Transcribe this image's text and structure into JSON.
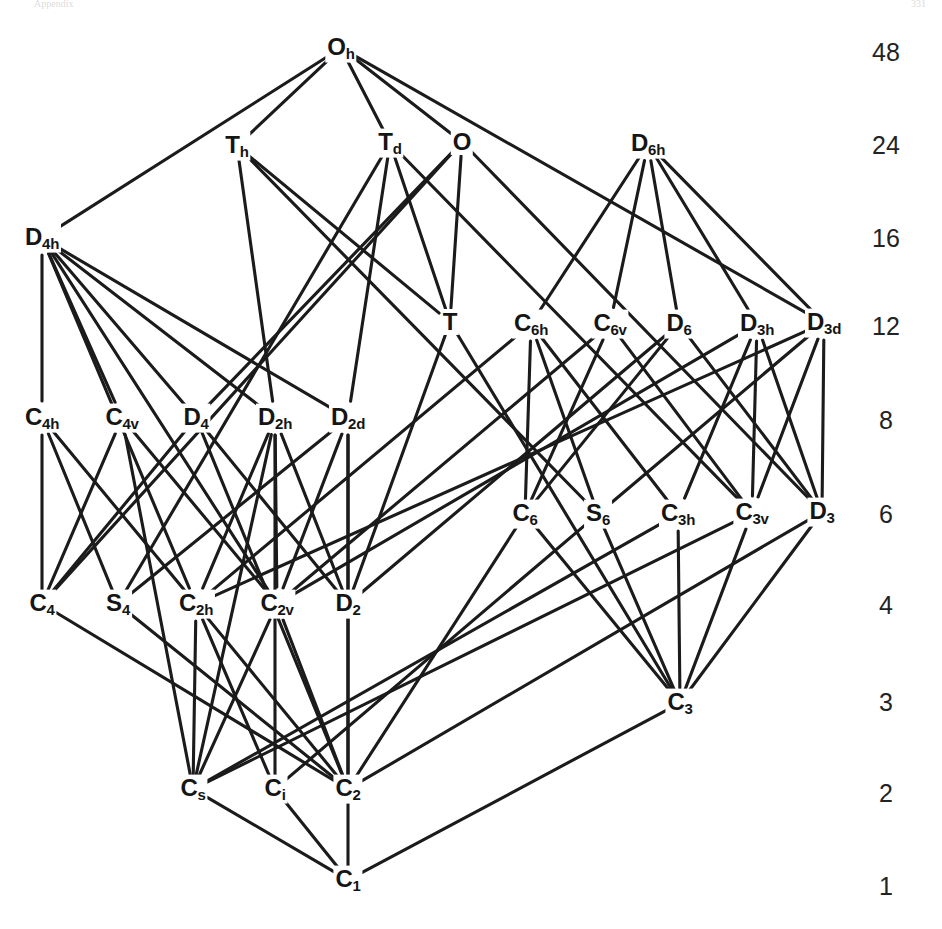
{
  "figure": {
    "kind": "subgroup-lattice",
    "header_left": "Appendix",
    "header_right": "331",
    "line_color": "#1b1b1b",
    "text_color": "#151515",
    "background": "#ffffff"
  },
  "order_axis": {
    "name": "group-order-column",
    "x": 886,
    "ticks": [
      {
        "label": "48",
        "y": 52
      },
      {
        "label": "24",
        "y": 145
      },
      {
        "label": "16",
        "y": 238
      },
      {
        "label": "12",
        "y": 326
      },
      {
        "label": "8",
        "y": 420
      },
      {
        "label": "6",
        "y": 514
      },
      {
        "label": "4",
        "y": 605
      },
      {
        "label": "3",
        "y": 702
      },
      {
        "label": "2",
        "y": 793
      },
      {
        "label": "1",
        "y": 886
      }
    ]
  },
  "nodes": [
    {
      "id": "Oh",
      "base": "O",
      "sub": "h",
      "x": 341,
      "y": 48,
      "order": 48
    },
    {
      "id": "Th",
      "base": "T",
      "sub": "h",
      "x": 237,
      "y": 146,
      "order": 24
    },
    {
      "id": "Td",
      "base": "T",
      "sub": "d",
      "x": 390,
      "y": 143,
      "order": 24
    },
    {
      "id": "O",
      "base": "O",
      "sub": "",
      "x": 462,
      "y": 142,
      "order": 24
    },
    {
      "id": "D6h",
      "base": "D",
      "sub": "6h",
      "x": 648,
      "y": 144,
      "order": 24
    },
    {
      "id": "D4h",
      "base": "D",
      "sub": "4h",
      "x": 42,
      "y": 238,
      "order": 16
    },
    {
      "id": "T",
      "base": "T",
      "sub": "",
      "x": 450,
      "y": 322,
      "order": 12
    },
    {
      "id": "C6h",
      "base": "C",
      "sub": "6h",
      "x": 531,
      "y": 324,
      "order": 12
    },
    {
      "id": "C6v",
      "base": "C",
      "sub": "6v",
      "x": 610,
      "y": 324,
      "order": 12
    },
    {
      "id": "D6",
      "base": "D",
      "sub": "6",
      "x": 679,
      "y": 324,
      "order": 12
    },
    {
      "id": "D3h",
      "base": "D",
      "sub": "3h",
      "x": 757,
      "y": 324,
      "order": 12
    },
    {
      "id": "D3d",
      "base": "D",
      "sub": "3d",
      "x": 824,
      "y": 323,
      "order": 12
    },
    {
      "id": "C4h",
      "base": "C",
      "sub": "4h",
      "x": 42,
      "y": 418,
      "order": 8
    },
    {
      "id": "C4v",
      "base": "C",
      "sub": "4v",
      "x": 122,
      "y": 418,
      "order": 8
    },
    {
      "id": "D4",
      "base": "D",
      "sub": "4",
      "x": 196,
      "y": 418,
      "order": 8
    },
    {
      "id": "D2h",
      "base": "D",
      "sub": "2h",
      "x": 275,
      "y": 418,
      "order": 8
    },
    {
      "id": "D2d",
      "base": "D",
      "sub": "2d",
      "x": 348,
      "y": 418,
      "order": 8
    },
    {
      "id": "C6",
      "base": "C",
      "sub": "6",
      "x": 525,
      "y": 514,
      "order": 6
    },
    {
      "id": "S6",
      "base": "S",
      "sub": "6",
      "x": 598,
      "y": 514,
      "order": 6
    },
    {
      "id": "C3h",
      "base": "C",
      "sub": "3h",
      "x": 678,
      "y": 514,
      "order": 6
    },
    {
      "id": "C3v",
      "base": "C",
      "sub": "3v",
      "x": 752,
      "y": 513,
      "order": 6
    },
    {
      "id": "D3",
      "base": "D",
      "sub": "3",
      "x": 822,
      "y": 512,
      "order": 6
    },
    {
      "id": "C4",
      "base": "C",
      "sub": "4",
      "x": 42,
      "y": 604,
      "order": 4
    },
    {
      "id": "S4",
      "base": "S",
      "sub": "4",
      "x": 118,
      "y": 604,
      "order": 4
    },
    {
      "id": "C2h",
      "base": "C",
      "sub": "2h",
      "x": 196,
      "y": 604,
      "order": 4
    },
    {
      "id": "C2v",
      "base": "C",
      "sub": "2v",
      "x": 277,
      "y": 604,
      "order": 4
    },
    {
      "id": "D2",
      "base": "D",
      "sub": "2",
      "x": 348,
      "y": 604,
      "order": 4
    },
    {
      "id": "C3",
      "base": "C",
      "sub": "3",
      "x": 680,
      "y": 703,
      "order": 3
    },
    {
      "id": "Cs",
      "base": "C",
      "sub": "s",
      "x": 193,
      "y": 789,
      "order": 2
    },
    {
      "id": "Ci",
      "base": "C",
      "sub": "i",
      "x": 275,
      "y": 789,
      "order": 2
    },
    {
      "id": "C2",
      "base": "C",
      "sub": "2",
      "x": 348,
      "y": 789,
      "order": 2
    },
    {
      "id": "C1",
      "base": "C",
      "sub": "1",
      "x": 348,
      "y": 880,
      "order": 1
    }
  ],
  "edges": [
    [
      "Oh",
      "D4h"
    ],
    [
      "Oh",
      "Th"
    ],
    [
      "Oh",
      "Td"
    ],
    [
      "Oh",
      "O"
    ],
    [
      "Oh",
      "D3d"
    ],
    [
      "Th",
      "D2h"
    ],
    [
      "Th",
      "T"
    ],
    [
      "Th",
      "S6"
    ],
    [
      "Td",
      "D2d"
    ],
    [
      "Td",
      "C3v"
    ],
    [
      "Td",
      "T"
    ],
    [
      "Td",
      "S4"
    ],
    [
      "O",
      "D4"
    ],
    [
      "O",
      "D3"
    ],
    [
      "O",
      "T"
    ],
    [
      "O",
      "C4"
    ],
    [
      "D6h",
      "C6h"
    ],
    [
      "D6h",
      "C6v"
    ],
    [
      "D6h",
      "D6"
    ],
    [
      "D6h",
      "D3h"
    ],
    [
      "D6h",
      "D3d"
    ],
    [
      "D4h",
      "C4h"
    ],
    [
      "D4h",
      "C4v"
    ],
    [
      "D4h",
      "D4"
    ],
    [
      "D4h",
      "D2h"
    ],
    [
      "D4h",
      "D2d"
    ],
    [
      "D4h",
      "C2h"
    ],
    [
      "D4h",
      "C2v"
    ],
    [
      "T",
      "D2"
    ],
    [
      "T",
      "C3"
    ],
    [
      "C6h",
      "C6"
    ],
    [
      "C6h",
      "S6"
    ],
    [
      "C6h",
      "C3h"
    ],
    [
      "C6h",
      "C2h"
    ],
    [
      "C6v",
      "C6"
    ],
    [
      "C6v",
      "C3v"
    ],
    [
      "C6v",
      "C2v"
    ],
    [
      "D6",
      "C6"
    ],
    [
      "D6",
      "D3"
    ],
    [
      "D6",
      "D2"
    ],
    [
      "D3h",
      "C3h"
    ],
    [
      "D3h",
      "C3v"
    ],
    [
      "D3h",
      "D3"
    ],
    [
      "D3h",
      "C2v"
    ],
    [
      "D3d",
      "S6"
    ],
    [
      "D3d",
      "C3v"
    ],
    [
      "D3d",
      "D3"
    ],
    [
      "D3d",
      "C2h"
    ],
    [
      "C4h",
      "C4"
    ],
    [
      "C4h",
      "S4"
    ],
    [
      "C4h",
      "C2h"
    ],
    [
      "C4v",
      "C4"
    ],
    [
      "C4v",
      "C2v"
    ],
    [
      "C4v",
      "Cs"
    ],
    [
      "D4",
      "C4"
    ],
    [
      "D4",
      "D2"
    ],
    [
      "D4",
      "C2"
    ],
    [
      "D2h",
      "C2h"
    ],
    [
      "D2h",
      "C2v"
    ],
    [
      "D2h",
      "D2"
    ],
    [
      "D2h",
      "Cs"
    ],
    [
      "D2h",
      "Ci"
    ],
    [
      "D2d",
      "S4"
    ],
    [
      "D2d",
      "C2v"
    ],
    [
      "D2d",
      "D2"
    ],
    [
      "D2d",
      "C2"
    ],
    [
      "C6",
      "C3"
    ],
    [
      "C6",
      "C2"
    ],
    [
      "S6",
      "C3"
    ],
    [
      "S6",
      "Ci"
    ],
    [
      "C3h",
      "C3"
    ],
    [
      "C3h",
      "Cs"
    ],
    [
      "C3v",
      "C3"
    ],
    [
      "C3v",
      "Cs"
    ],
    [
      "D3",
      "C3"
    ],
    [
      "D3",
      "C2"
    ],
    [
      "C4",
      "C2"
    ],
    [
      "S4",
      "C2"
    ],
    [
      "C2h",
      "C2"
    ],
    [
      "C2h",
      "Cs"
    ],
    [
      "C2h",
      "Ci"
    ],
    [
      "C2v",
      "C2"
    ],
    [
      "C2v",
      "Cs"
    ],
    [
      "D2",
      "C2"
    ],
    [
      "C3",
      "C1"
    ],
    [
      "Cs",
      "C1"
    ],
    [
      "Ci",
      "C1"
    ],
    [
      "C2",
      "C1"
    ]
  ]
}
